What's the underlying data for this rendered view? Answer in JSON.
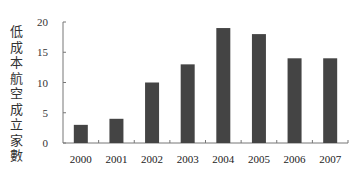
{
  "chart_data": {
    "type": "bar",
    "title": "",
    "xlabel": "",
    "ylabel": "低成本航空成立家數",
    "categories": [
      "2000",
      "2001",
      "2002",
      "2003",
      "2004",
      "2005",
      "2006",
      "2007"
    ],
    "values": [
      3,
      4,
      10,
      13,
      19,
      18,
      14,
      14
    ],
    "ylim": [
      0,
      20
    ],
    "yticks": [
      0,
      5,
      10,
      15,
      20
    ],
    "grid": false,
    "legend": null,
    "bar_color": "#444444"
  }
}
